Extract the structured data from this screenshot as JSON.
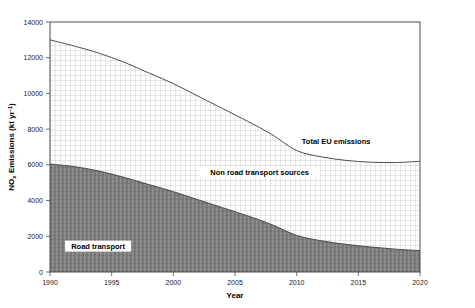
{
  "chart_data": {
    "type": "area",
    "title": "",
    "xlabel": "Year",
    "ylabel": "NOx Emissions (kt yr-1)",
    "ylabel_parts": {
      "pre": "NO",
      "sub": "x",
      "mid": " Emissions (kt yr",
      "sup": "-1",
      "post": ")"
    },
    "xlim": [
      1990,
      2020
    ],
    "ylim": [
      0,
      14000
    ],
    "xticks": [
      1990,
      1995,
      2000,
      2005,
      2010,
      2015,
      2020
    ],
    "xtick_labels": [
      "1990",
      "1995",
      "2000",
      "2005",
      "2010",
      "2015",
      "2020"
    ],
    "yticks": [
      0,
      2000,
      4000,
      6000,
      8000,
      10000,
      12000,
      14000
    ],
    "ytick_labels": [
      "0",
      "2000",
      "4000",
      "6000",
      "8000",
      "10000",
      "12000",
      "14000"
    ],
    "grid": false,
    "legend_position": "inline-annotations",
    "stacked": true,
    "x": [
      1990,
      1992,
      1994,
      1996,
      1998,
      2000,
      2002,
      2004,
      2006,
      2008,
      2010,
      2012,
      2014,
      2016,
      2018,
      2020
    ],
    "series": [
      {
        "name": "Road transport",
        "fill": "#808080",
        "pattern": "solid-dark-gray-texture",
        "values": [
          6050,
          5900,
          5650,
          5300,
          4900,
          4500,
          4050,
          3600,
          3150,
          2650,
          2050,
          1750,
          1550,
          1400,
          1280,
          1200
        ]
      },
      {
        "name": "Non road transport sources",
        "fill": "#ffffff",
        "pattern": "fine-crosshatch-grid",
        "values": [
          6950,
          6750,
          6600,
          6450,
          6250,
          6050,
          5800,
          5550,
          5300,
          5050,
          4750,
          4700,
          4700,
          4750,
          4850,
          5000
        ]
      }
    ],
    "total_series": {
      "name": "Total EU emissions",
      "values": [
        13000,
        12650,
        12250,
        11750,
        11150,
        10550,
        9850,
        9150,
        8450,
        7700,
        6800,
        6450,
        6250,
        6150,
        6130,
        6200
      ]
    },
    "annotations": [
      {
        "name": "total-eu-emissions",
        "label": "Total EU emissions",
        "x": 2013.2,
        "y": 7350
      },
      {
        "name": "non-road-transport-sources",
        "label": "Non road transport  sources",
        "x": 2007.0,
        "y": 5600
      },
      {
        "name": "road-transport",
        "label": "Road transport",
        "x": 1993.9,
        "y": 1450
      }
    ]
  }
}
